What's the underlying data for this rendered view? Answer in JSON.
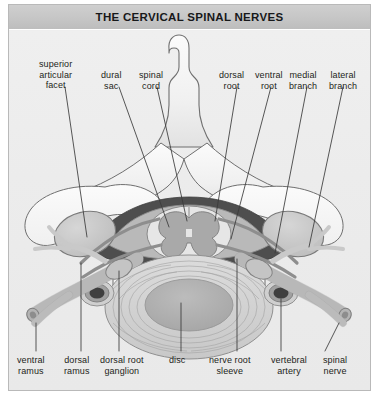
{
  "header": {
    "title": "THE CERVICAL SPINAL NERVES"
  },
  "figure": {
    "background_color": "#ececec",
    "panel_border_color": "#b9b9b9",
    "titlebar_color": "#c6c6c6",
    "leader_line_color": "#3a3a3a"
  },
  "labels": {
    "top": [
      {
        "id": "superior-articular-facet",
        "lines": [
          "superior",
          "articular",
          "facet"
        ]
      },
      {
        "id": "dural-sac",
        "lines": [
          "dural",
          "sac"
        ]
      },
      {
        "id": "spinal-cord",
        "lines": [
          "spinal",
          "cord"
        ]
      },
      {
        "id": "dorsal-root",
        "lines": [
          "dorsal",
          "root"
        ]
      },
      {
        "id": "ventral-root",
        "lines": [
          "ventral",
          "root"
        ]
      },
      {
        "id": "medial-branch",
        "lines": [
          "medial",
          "branch"
        ]
      },
      {
        "id": "lateral-branch",
        "lines": [
          "lateral",
          "branch"
        ]
      }
    ],
    "bottom": [
      {
        "id": "ventral-ramus",
        "lines": [
          "ventral",
          "ramus"
        ]
      },
      {
        "id": "dorsal-ramus",
        "lines": [
          "dorsal",
          "ramus"
        ]
      },
      {
        "id": "dorsal-root-ganglion",
        "lines": [
          "dorsal root",
          "ganglion"
        ]
      },
      {
        "id": "disc",
        "lines": [
          "disc"
        ]
      },
      {
        "id": "nerve-root-sleeve",
        "lines": [
          "nerve root",
          "sleeve"
        ]
      },
      {
        "id": "vertebral-artery",
        "lines": [
          "vertebral",
          "artery"
        ]
      },
      {
        "id": "spinal-nerve",
        "lines": [
          "spinal",
          "nerve"
        ]
      }
    ]
  },
  "anatomy_colors": {
    "bone_light": "#f2f2f2",
    "bone_shade": "#d8d8d8",
    "bone_outline": "#6e6e6e",
    "epidural_dark": "#4a4a4a",
    "dural_sac": "#b9b9b9",
    "gray_matter": "#a8a8a8",
    "white_matter": "#e4e4e4",
    "disc_annulus": "#d2d2d2",
    "disc_nucleus": "#b0b0b0",
    "artery_wall": "#9a9a9a",
    "artery_lumen": "#3f3f3f",
    "nerve_body": "#cfcfcf",
    "facet_fill": "#c9c9c9"
  }
}
